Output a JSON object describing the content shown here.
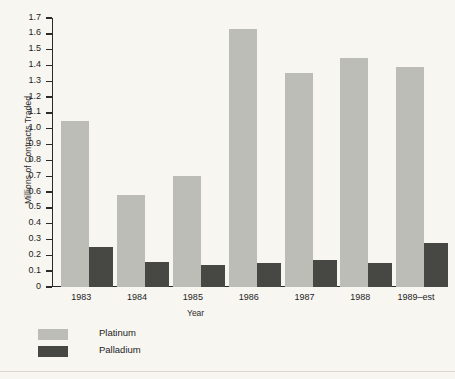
{
  "chart_data": {
    "type": "bar",
    "title": "",
    "xlabel": "Year",
    "ylabel": "Millions of Contracts Traded",
    "categories": [
      "1983",
      "1984",
      "1985",
      "1986",
      "1987",
      "1988",
      "1989–est"
    ],
    "series": [
      {
        "name": "Platinum",
        "color": "#bdbdb8",
        "values": [
          1.05,
          0.58,
          0.7,
          1.63,
          1.35,
          1.45,
          1.39
        ]
      },
      {
        "name": "Palladium",
        "color": "#474744",
        "values": [
          0.25,
          0.16,
          0.14,
          0.15,
          0.17,
          0.15,
          0.28
        ]
      }
    ],
    "ylim": [
      0,
      1.7
    ],
    "ytick_step": 0.1,
    "yticks": [
      "1.7",
      "1.6",
      "1.5",
      "1.4",
      "1.3",
      "1.2",
      "1.1",
      "1.0",
      "0.9",
      "0.8",
      "0.7",
      "0.6",
      "0.5",
      "0.4",
      "0.3",
      "0.2",
      "0.1",
      "0"
    ],
    "grid": false,
    "legend_position": "bottom-left"
  },
  "legend": {
    "items": [
      {
        "label": "Platinum",
        "color": "#bdbdb8"
      },
      {
        "label": "Palladium",
        "color": "#474744"
      }
    ]
  },
  "colors": {
    "background": "#f7f6f1",
    "axis": "#2b2b2b",
    "text": "#1d1d1d",
    "platinum": "#bdbdb8",
    "palladium": "#474744"
  }
}
